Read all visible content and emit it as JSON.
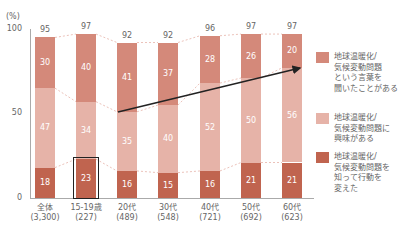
{
  "chart_data": {
    "type": "bar",
    "stacked": true,
    "unit_label": "(%)",
    "ylim": [
      0,
      100
    ],
    "yticks": [
      "0",
      "50",
      "100"
    ],
    "categories": [
      "全体",
      "15-19歳",
      "20代",
      "30代",
      "40代",
      "50代",
      "60代"
    ],
    "category_n": [
      "(3,300)",
      "(227)",
      "(489)",
      "(548)",
      "(721)",
      "(692)",
      "(623)"
    ],
    "totals": [
      95,
      97,
      92,
      92,
      96,
      97,
      97
    ],
    "series": [
      {
        "name": "地球温暖化/気候変動問題を知って行動を変えた",
        "color": "#c0644f",
        "values": [
          18,
          23,
          16,
          15,
          16,
          21,
          21
        ]
      },
      {
        "name": "地球温暖化/気候変動問題に興味がある",
        "color": "#e6b3a8",
        "values": [
          47,
          34,
          35,
          40,
          52,
          50,
          56
        ]
      },
      {
        "name": "地球温暖化/気候変動問題という言葉を聞いたことがある",
        "color": "#d4897a",
        "values": [
          30,
          40,
          41,
          37,
          28,
          26,
          20
        ]
      }
    ],
    "legend": [
      {
        "color": "#d4897a",
        "lines": [
          "地球温暖化/",
          "気候変動問題",
          "という言葉を",
          "聞いたことがある"
        ]
      },
      {
        "color": "#e6b3a8",
        "lines": [
          "地球温暖化/",
          "気候変動問題に",
          "興味がある"
        ]
      },
      {
        "color": "#c0644f",
        "lines": [
          "地球温暖化/",
          "気候変動問題を",
          "知って行動を",
          "変えた"
        ]
      }
    ],
    "annotations": {
      "highlight_box": "15-19歳 行動を変えた (23)",
      "arrow": "20代 → 60代 興味がある trend"
    },
    "legend_position": "right",
    "grid": false
  }
}
